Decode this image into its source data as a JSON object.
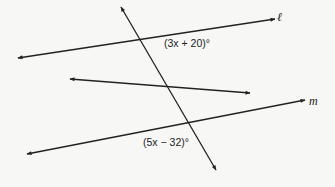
{
  "diagram": {
    "type": "parallel-lines-transversal",
    "lines": [
      {
        "id": "l",
        "label": "ℓ",
        "x1": 18,
        "y1": 58,
        "x2": 275,
        "y2": 19
      },
      {
        "id": "middle",
        "label": "",
        "x1": 70,
        "y1": 79,
        "x2": 250,
        "y2": 93
      },
      {
        "id": "m",
        "label": "m",
        "x1": 27,
        "y1": 154,
        "x2": 305,
        "y2": 100
      },
      {
        "id": "transversal",
        "label": "",
        "x1": 121,
        "y1": 7,
        "x2": 216,
        "y2": 170
      }
    ],
    "angles": [
      {
        "id": "angle-top",
        "label": "(3x + 20)°"
      },
      {
        "id": "angle-bottom",
        "label": "(5x − 32)°"
      }
    ],
    "stroke_color": "#222222"
  }
}
